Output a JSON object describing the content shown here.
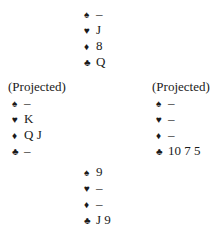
{
  "hands": {
    "north": {
      "label": "",
      "suits": [
        {
          "suit": "spades",
          "symbol": "♠",
          "cards": "–"
        },
        {
          "suit": "hearts",
          "symbol": "♥",
          "cards": "J"
        },
        {
          "suit": "diamonds",
          "symbol": "♦",
          "cards": "8"
        },
        {
          "suit": "clubs",
          "symbol": "♣",
          "cards": "Q"
        }
      ]
    },
    "west": {
      "label": "(Projected)",
      "suits": [
        {
          "suit": "spades",
          "symbol": "♠",
          "cards": "–"
        },
        {
          "suit": "hearts",
          "symbol": "♥",
          "cards": "K"
        },
        {
          "suit": "diamonds",
          "symbol": "♦",
          "cards": "Q J"
        },
        {
          "suit": "clubs",
          "symbol": "♣",
          "cards": "–"
        }
      ]
    },
    "east": {
      "label": "(Projected)",
      "suits": [
        {
          "suit": "spades",
          "symbol": "♠",
          "cards": "–"
        },
        {
          "suit": "hearts",
          "symbol": "♥",
          "cards": "–"
        },
        {
          "suit": "diamonds",
          "symbol": "♦",
          "cards": "–"
        },
        {
          "suit": "clubs",
          "symbol": "♣",
          "cards": "10 7 5"
        }
      ]
    },
    "south": {
      "label": "",
      "suits": [
        {
          "suit": "spades",
          "symbol": "♠",
          "cards": "9"
        },
        {
          "suit": "hearts",
          "symbol": "♥",
          "cards": "–"
        },
        {
          "suit": "diamonds",
          "symbol": "♦",
          "cards": "–"
        },
        {
          "suit": "clubs",
          "symbol": "♣",
          "cards": "J 9"
        }
      ]
    }
  }
}
